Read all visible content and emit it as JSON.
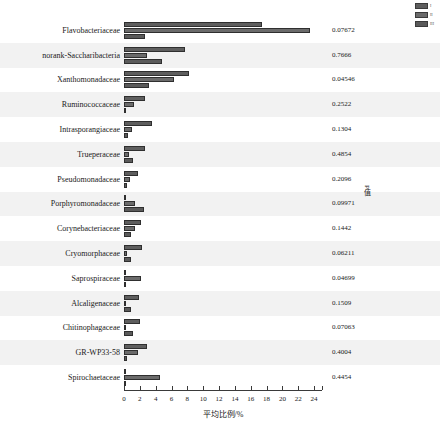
{
  "chart_data": {
    "type": "bar",
    "orientation": "horizontal",
    "title": "",
    "xlabel": "平均比例/%",
    "ylabel": "",
    "xlim": [
      0,
      25
    ],
    "grid": false,
    "banded_rows": true,
    "legend": {
      "position": "top-right",
      "entries": [
        {
          "name": "I",
          "color": "#5e5e5e"
        },
        {
          "name": "II",
          "color": "#6b6b6b"
        },
        {
          "name": "III",
          "color": "#5a5a5a"
        }
      ]
    },
    "xticks": [
      0,
      2,
      4,
      6,
      8,
      10,
      12,
      14,
      16,
      18,
      20,
      22,
      24
    ],
    "xticklabels": [
      "0",
      "2",
      "4",
      "6",
      "8",
      "10",
      "12",
      "14",
      "16",
      "18",
      "20",
      "22",
      "24"
    ],
    "categories": [
      "Flavobacteriaceae",
      "norank-Saccharibacteria",
      "Xanthomonadaceae",
      "Ruminococcaceae",
      "Intrasporangiaceae",
      "Trueperaceae",
      "Pseudomonadaceae",
      "Porphyromonadaceae",
      "Corynebacteriaceae",
      "Cryomorphaceae",
      "Saprospiraceae",
      "Alcaligenaceae",
      "Chitinophagaceae",
      "GR-WP33-58",
      "Spirochaetaceae"
    ],
    "series": [
      {
        "name": "I",
        "color": "#5e5e5e",
        "values": [
          17.4,
          7.7,
          8.2,
          2.6,
          3.5,
          2.6,
          1.8,
          0.3,
          2.2,
          2.3,
          0.3,
          1.9,
          2.0,
          2.9,
          0.3
        ]
      },
      {
        "name": "II",
        "color": "#6b6b6b",
        "values": [
          23.5,
          2.9,
          6.3,
          1.2,
          1.0,
          0.6,
          0.7,
          1.4,
          1.4,
          0.4,
          2.2,
          0.2,
          0.3,
          1.8,
          4.6
        ]
      },
      {
        "name": "III",
        "color": "#5a5a5a",
        "values": [
          2.6,
          4.8,
          3.1,
          0.2,
          0.5,
          1.1,
          0.4,
          2.5,
          0.9,
          0.9,
          0.2,
          0.9,
          1.1,
          0.4,
          0.2
        ]
      }
    ],
    "pvalue_column": {
      "title": "P值",
      "values": [
        "0.07672",
        "0.7666",
        "0.04546",
        "0.2522",
        "0.1304",
        "0.4854",
        "0.2096",
        "0.09971",
        "0.1442",
        "0.06211",
        "0.04699",
        "0.1509",
        "0.07063",
        "0.4004",
        "0.4454"
      ]
    }
  }
}
